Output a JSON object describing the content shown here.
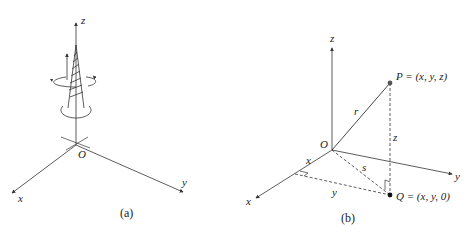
{
  "figure": {
    "panel_a": {
      "caption": "(a)",
      "axes": {
        "x": "x",
        "y": "y",
        "z": "z"
      },
      "origin": "O"
    },
    "panel_b": {
      "caption": "(b)",
      "axes": {
        "x": "x",
        "y": "y",
        "z": "z"
      },
      "origin": "O",
      "point_P": "P = (x, y, z)",
      "point_Q": "Q = (x, y, 0)",
      "segment_labels": {
        "r": "r",
        "z": "z",
        "s": "s",
        "x": "x",
        "y": "y"
      }
    },
    "colors": {
      "ink": "#333333",
      "point": "#222222",
      "background": "#ffffff"
    }
  }
}
